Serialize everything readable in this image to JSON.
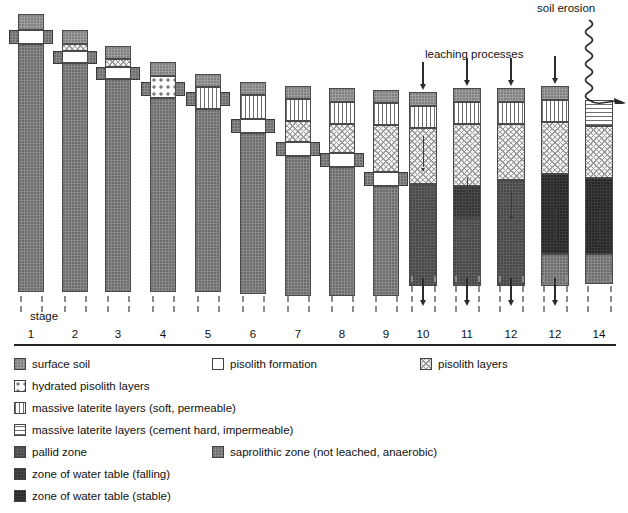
{
  "figure": {
    "type": "diagram",
    "axis_label": "stage",
    "annotations": {
      "leaching": "leaching processes",
      "erosion": "soil erosion"
    }
  },
  "stage_labels": [
    "1",
    "2",
    "3",
    "4",
    "5",
    "6",
    "7",
    "8",
    "9",
    "10",
    "11",
    "12",
    "12",
    "14"
  ],
  "legend": [
    {
      "key": "surface-soil",
      "label": "surface soil",
      "fill": "f-soil"
    },
    {
      "key": "pisolith-formation",
      "label": "pisolith formation",
      "fill": "f-pisoform"
    },
    {
      "key": "pisolith-layers",
      "label": "pisolith layers",
      "fill": "f-pisolayer"
    },
    {
      "key": "hydrated-pisolith",
      "label": "hydrated pisolith layers",
      "fill": "f-hydpiso"
    },
    {
      "key": "laterite-soft",
      "label": "massive laterite layers (soft, permeable)",
      "fill": "f-lat-soft"
    },
    {
      "key": "laterite-hard",
      "label": "massive laterite layers (cement hard, impermeable)",
      "fill": "f-lat-hard"
    },
    {
      "key": "pallid-zone",
      "label": "pallid zone",
      "fill": "f-pallid"
    },
    {
      "key": "saprolithic-zone",
      "label": "saprolithic zone (not leached, anaerobic)",
      "fill": "f-saprolith"
    },
    {
      "key": "water-table-falling",
      "label": "zone of water table (falling)",
      "fill": "f-wtfall"
    },
    {
      "key": "water-table-stable",
      "label": "zone of water table (stable)",
      "fill": "f-wtstable"
    }
  ],
  "colors": {
    "surface_soil": "#9e9e9e",
    "saprolithic": "#8a8a8a",
    "pallid": "#5e5e5e",
    "water_table_falling": "#4a4a4a",
    "water_table_stable": "#3a3a3a",
    "pisolith_formation": "#ffffff",
    "outline": "#4a4a4a",
    "arrow": "#2b2b2b"
  },
  "chart_data": {
    "type": "diagram",
    "xlabel": "stage",
    "columns": [
      {
        "stage": "1",
        "x": 18,
        "w": 26,
        "top": 14,
        "layers": [
          {
            "fill": "f-soil",
            "h": 16
          },
          {
            "fill": "f-pisoform",
            "h": 14
          },
          {
            "fill": "f-saprolith",
            "h": 248
          }
        ],
        "wing": {
          "y": 30,
          "h": 14
        },
        "arrows": []
      },
      {
        "stage": "2",
        "x": 62,
        "w": 26,
        "top": 30,
        "layers": [
          {
            "fill": "f-soil",
            "h": 14
          },
          {
            "fill": "f-pisolayer",
            "h": 7
          },
          {
            "fill": "f-pisoform",
            "h": 12
          },
          {
            "fill": "f-saprolith",
            "h": 229
          }
        ],
        "wing": {
          "y": 51,
          "h": 13
        },
        "arrows": []
      },
      {
        "stage": "3",
        "x": 105,
        "w": 26,
        "top": 46,
        "layers": [
          {
            "fill": "f-soil",
            "h": 13
          },
          {
            "fill": "f-pisolayer",
            "h": 8
          },
          {
            "fill": "f-pisoform",
            "h": 12
          },
          {
            "fill": "f-saprolith",
            "h": 213
          }
        ],
        "wing": {
          "y": 67,
          "h": 13
        },
        "arrows": []
      },
      {
        "stage": "4",
        "x": 150,
        "w": 26,
        "top": 62,
        "layers": [
          {
            "fill": "f-soil",
            "h": 14
          },
          {
            "fill": "f-hydpiso",
            "h": 22
          },
          {
            "fill": "f-saprolith",
            "h": 194
          }
        ],
        "wing": {
          "y": 82,
          "h": 14
        },
        "arrows": []
      },
      {
        "stage": "5",
        "x": 195,
        "w": 26,
        "top": 74,
        "layers": [
          {
            "fill": "f-soil",
            "h": 13
          },
          {
            "fill": "f-lat-soft",
            "h": 22
          },
          {
            "fill": "f-saprolith",
            "h": 183
          }
        ],
        "wing": {
          "y": 92,
          "h": 14
        },
        "arrows": []
      },
      {
        "stage": "6",
        "x": 240,
        "w": 26,
        "top": 82,
        "layers": [
          {
            "fill": "f-soil",
            "h": 13
          },
          {
            "fill": "f-lat-soft",
            "h": 24
          },
          {
            "fill": "f-pisoform",
            "h": 14
          },
          {
            "fill": "f-saprolith",
            "h": 161
          }
        ],
        "wing": {
          "y": 119,
          "h": 14
        },
        "arrows": []
      },
      {
        "stage": "7",
        "x": 285,
        "w": 26,
        "top": 86,
        "layers": [
          {
            "fill": "f-soil",
            "h": 13
          },
          {
            "fill": "f-lat-soft",
            "h": 22
          },
          {
            "fill": "f-pisolayer",
            "h": 21
          },
          {
            "fill": "f-pisoform",
            "h": 14
          },
          {
            "fill": "f-saprolith",
            "h": 140
          }
        ],
        "wing": {
          "y": 142,
          "h": 14
        },
        "arrows": []
      },
      {
        "stage": "8",
        "x": 329,
        "w": 26,
        "top": 88,
        "layers": [
          {
            "fill": "f-soil",
            "h": 14
          },
          {
            "fill": "f-lat-soft",
            "h": 22
          },
          {
            "fill": "f-pisolayer",
            "h": 29
          },
          {
            "fill": "f-pisoform",
            "h": 14
          },
          {
            "fill": "f-saprolith",
            "h": 129
          }
        ],
        "wing": {
          "y": 153,
          "h": 14
        },
        "arrows": []
      },
      {
        "stage": "9",
        "x": 373,
        "w": 26,
        "top": 90,
        "layers": [
          {
            "fill": "f-soil",
            "h": 13
          },
          {
            "fill": "f-lat-soft",
            "h": 22
          },
          {
            "fill": "f-pisolayer",
            "h": 47
          },
          {
            "fill": "f-pisoform",
            "h": 14
          },
          {
            "fill": "f-saprolith",
            "h": 110
          }
        ],
        "wing": {
          "y": 172,
          "h": 14
        },
        "arrows": []
      },
      {
        "stage": "10",
        "x": 409,
        "w": 28,
        "top": 92,
        "layers": [
          {
            "fill": "f-soil",
            "h": 14
          },
          {
            "fill": "f-lat-soft",
            "h": 22
          },
          {
            "fill": "f-pisolayer",
            "h": 56
          },
          {
            "fill": "f-pallid",
            "h": 102
          }
        ],
        "wing": null,
        "arrows": [
          {
            "kind": "leach-top",
            "y": 62,
            "h": 28
          },
          {
            "kind": "inner-thin",
            "y": 136,
            "h": 36
          },
          {
            "kind": "below",
            "y": 278,
            "h": 28
          }
        ]
      },
      {
        "stage": "11",
        "x": 453,
        "w": 28,
        "top": 88,
        "layers": [
          {
            "fill": "f-soil",
            "h": 14
          },
          {
            "fill": "f-lat-soft",
            "h": 22
          },
          {
            "fill": "f-pisolayer",
            "h": 62
          },
          {
            "fill": "f-wtfall",
            "h": 32
          },
          {
            "fill": "f-pallid",
            "h": 68
          }
        ],
        "wing": null,
        "arrows": [
          {
            "kind": "leach-top",
            "y": 58,
            "h": 28
          },
          {
            "kind": "inner-thin",
            "y": 178,
            "h": 32
          },
          {
            "kind": "below",
            "y": 278,
            "h": 28
          }
        ]
      },
      {
        "stage": "12",
        "x": 497,
        "w": 28,
        "top": 88,
        "layers": [
          {
            "fill": "f-soil",
            "h": 14
          },
          {
            "fill": "f-lat-soft",
            "h": 22
          },
          {
            "fill": "f-pisolayer",
            "h": 56
          },
          {
            "fill": "f-pallid",
            "h": 106
          }
        ],
        "wing": null,
        "arrows": [
          {
            "kind": "leach-top",
            "y": 58,
            "h": 28
          },
          {
            "kind": "inner-thin",
            "y": 190,
            "h": 30
          },
          {
            "kind": "below",
            "y": 278,
            "h": 28
          }
        ]
      },
      {
        "stage": "12b",
        "x": 541,
        "w": 28,
        "top": 86,
        "layers": [
          {
            "fill": "f-soil",
            "h": 14
          },
          {
            "fill": "f-lat-soft",
            "h": 22
          },
          {
            "fill": "f-pisolayer",
            "h": 52
          },
          {
            "fill": "f-wtstable",
            "h": 80
          },
          {
            "fill": "f-saprolith",
            "h": 32
          }
        ],
        "wing": null,
        "arrows": [
          {
            "kind": "leach-top",
            "y": 56,
            "h": 28
          },
          {
            "kind": "inner-thin",
            "y": 208,
            "h": 34
          },
          {
            "kind": "below",
            "y": 278,
            "h": 28
          }
        ]
      },
      {
        "stage": "14",
        "x": 585,
        "w": 28,
        "top": 100,
        "layers": [
          {
            "fill": "f-lat-hard",
            "h": 26
          },
          {
            "fill": "f-pisolayer",
            "h": 52
          },
          {
            "fill": "f-wtstable",
            "h": 76
          },
          {
            "fill": "f-saprolith",
            "h": 30
          }
        ],
        "wing": null,
        "arrows": [
          {
            "kind": "inner-thin",
            "y": 210,
            "h": 34
          }
        ],
        "erosion": true
      }
    ]
  }
}
